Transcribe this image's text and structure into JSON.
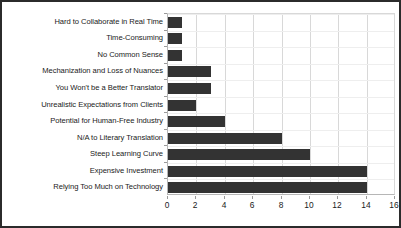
{
  "chart_data": {
    "type": "bar",
    "orientation": "horizontal",
    "title": "",
    "subtitle": "",
    "xlabel": "",
    "ylabel": "",
    "xlim": [
      0,
      16
    ],
    "ylim": null,
    "grid": true,
    "legend": null,
    "legend_position": "none",
    "bar_color": "#333333",
    "xticks": [
      0,
      2,
      4,
      6,
      8,
      10,
      12,
      14,
      16
    ],
    "xtick_labels": [
      "0",
      "2",
      "4",
      "6",
      "8",
      "10",
      "12",
      "14",
      "16"
    ],
    "categories": [
      "Hard to Collaborate in Real Time",
      "Time-Consuming",
      "No Common Sense",
      "Mechanization and Loss of Nuances",
      "You Won't be a Better Translator",
      "Unrealistic Expectations from Clients",
      "Potential for Human-Free Industry",
      "N/A to Literary Translation",
      "Steep Learning Curve",
      "Expensive Investment",
      "Relying Too Much on Technology"
    ],
    "values": [
      1,
      1,
      1,
      3,
      3,
      2,
      4,
      8,
      10,
      14,
      14
    ]
  }
}
